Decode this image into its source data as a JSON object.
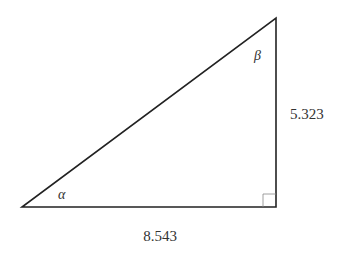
{
  "diagram": {
    "type": "right-triangle",
    "vertices": {
      "bottom_left": [
        22,
        207
      ],
      "bottom_right": [
        276,
        207
      ],
      "top": [
        276,
        18
      ]
    },
    "stroke_color": "#222222",
    "right_angle_at": "bottom_right",
    "labels": {
      "base": "8.543",
      "height": "5.323",
      "angle_bottom_left": "α",
      "angle_top": "β"
    }
  }
}
